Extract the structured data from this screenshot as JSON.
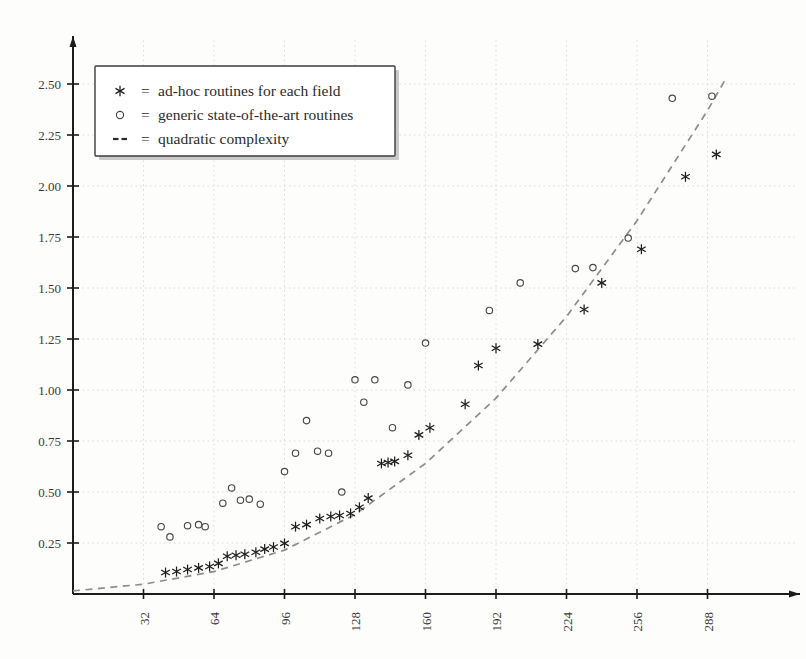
{
  "chart_data": {
    "type": "scatter",
    "title": "",
    "xlabel": "",
    "ylabel": "",
    "xlim": [
      0,
      300
    ],
    "ylim": [
      0,
      2.6
    ],
    "grid": true,
    "legend_position": "top-left",
    "xticks": [
      32,
      64,
      96,
      128,
      160,
      192,
      224,
      256,
      288
    ],
    "yticks": [
      "0.25",
      "0.50",
      "0.75",
      "1.00",
      "1.25",
      "1.50",
      "1.75",
      "2.00",
      "2.25",
      "2.50"
    ],
    "xtick_labels": [
      "32",
      "64",
      "96",
      "128",
      "160",
      "192",
      "224",
      "256",
      "288"
    ],
    "legend": [
      {
        "marker": "asterisk",
        "symbol": "*",
        "equals": "=",
        "label": "ad-hoc routines for each field"
      },
      {
        "marker": "circle",
        "symbol": "o",
        "equals": "=",
        "label": "generic state-of-the-art routines"
      },
      {
        "marker": "dashed",
        "symbol": "--",
        "equals": "=",
        "label": "quadratic complexity"
      }
    ],
    "series": [
      {
        "name": "ad-hoc routines for each field",
        "marker": "asterisk",
        "points": [
          [
            42,
            0.105
          ],
          [
            47,
            0.11
          ],
          [
            52,
            0.12
          ],
          [
            57,
            0.128
          ],
          [
            62,
            0.135
          ],
          [
            66,
            0.15
          ],
          [
            70,
            0.185
          ],
          [
            74,
            0.19
          ],
          [
            78,
            0.195
          ],
          [
            83,
            0.205
          ],
          [
            87,
            0.22
          ],
          [
            91,
            0.23
          ],
          [
            96,
            0.248
          ],
          [
            101,
            0.33
          ],
          [
            106,
            0.34
          ],
          [
            112,
            0.37
          ],
          [
            117,
            0.38
          ],
          [
            121,
            0.385
          ],
          [
            126,
            0.395
          ],
          [
            130,
            0.425
          ],
          [
            134,
            0.47
          ],
          [
            140,
            0.64
          ],
          [
            143,
            0.645
          ],
          [
            146,
            0.65
          ],
          [
            152,
            0.68
          ],
          [
            157,
            0.78
          ],
          [
            162,
            0.815
          ],
          [
            178,
            0.93
          ],
          [
            184,
            1.12
          ],
          [
            192,
            1.205
          ],
          [
            211,
            1.225
          ],
          [
            232,
            1.395
          ],
          [
            240,
            1.525
          ],
          [
            258,
            1.69
          ],
          [
            278,
            2.045
          ],
          [
            292,
            2.155
          ]
        ]
      },
      {
        "name": "generic state-of-the-art routines",
        "marker": "circle",
        "points": [
          [
            40,
            0.33
          ],
          [
            44,
            0.28
          ],
          [
            52,
            0.335
          ],
          [
            57,
            0.34
          ],
          [
            60,
            0.33
          ],
          [
            68,
            0.445
          ],
          [
            72,
            0.52
          ],
          [
            76,
            0.46
          ],
          [
            80,
            0.465
          ],
          [
            85,
            0.44
          ],
          [
            96,
            0.6
          ],
          [
            101,
            0.69
          ],
          [
            106,
            0.85
          ],
          [
            111,
            0.7
          ],
          [
            116,
            0.69
          ],
          [
            122,
            0.5
          ],
          [
            128,
            1.05
          ],
          [
            132,
            0.94
          ],
          [
            137,
            1.05
          ],
          [
            145,
            0.815
          ],
          [
            152,
            1.025
          ],
          [
            160,
            1.23
          ],
          [
            189,
            1.39
          ],
          [
            203,
            1.525
          ],
          [
            228,
            1.595
          ],
          [
            236,
            1.6
          ],
          [
            252,
            1.745
          ],
          [
            272,
            2.43
          ],
          [
            290,
            2.44
          ]
        ]
      }
    ],
    "quadratic_curve": {
      "name": "quadratic complexity",
      "style": "dashed",
      "points": [
        [
          0,
          0.015
        ],
        [
          32,
          0.048
        ],
        [
          64,
          0.11
        ],
        [
          96,
          0.215
        ],
        [
          128,
          0.39
        ],
        [
          160,
          0.64
        ],
        [
          192,
          0.96
        ],
        [
          224,
          1.36
        ],
        [
          256,
          1.83
        ],
        [
          288,
          2.37
        ],
        [
          296,
          2.52
        ]
      ]
    }
  }
}
